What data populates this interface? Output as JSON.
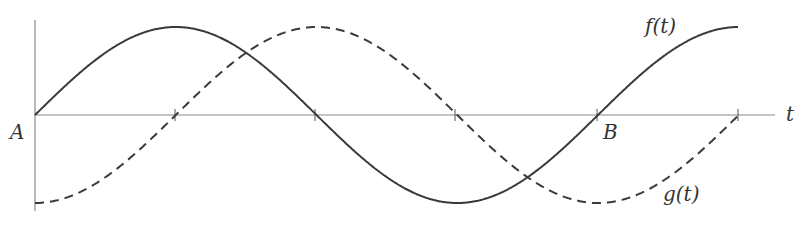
{
  "diagram": {
    "labels": {
      "origin": "A",
      "point_b": "B",
      "t_axis": "t",
      "f_curve": "f(t)",
      "g_curve": "g(t)"
    },
    "colors": {
      "curve": "#3a3a3a",
      "axis": "#8a8a8a",
      "background": "#ffffff"
    },
    "curves": [
      {
        "name": "f(t)",
        "style": "solid",
        "shape": "sine",
        "description": "starts at 0 at A, peaks, crosses zero, minimum, crosses zero at B, peaks at end"
      },
      {
        "name": "g(t)",
        "style": "dashed",
        "shape": "negative cosine",
        "description": "starts at minimum at A, zero, peaks, zero, minimum, zero at end"
      }
    ],
    "geometry": {
      "origin_x": 35,
      "axis_y": 115,
      "quarter_period_px": 140.75,
      "amplitude_px": 88,
      "tick_xs": [
        175,
        315,
        455,
        597,
        738
      ],
      "x_axis_end": 775,
      "y_axis_top": 20,
      "y_axis_bottom": 211
    }
  }
}
